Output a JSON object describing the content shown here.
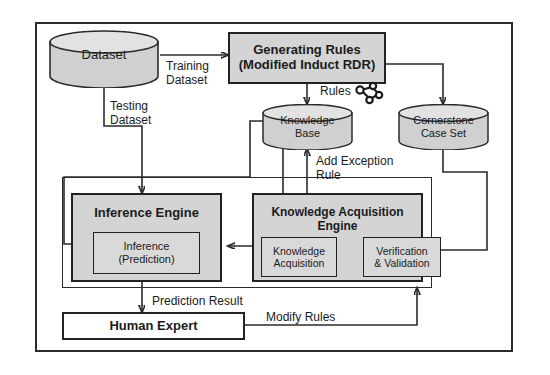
{
  "figure": {
    "type": "block-flow-diagram"
  },
  "outer_frame": {
    "name": "system-boundary"
  },
  "nodes": {
    "dataset": {
      "label": "Dataset",
      "shape": "cylinder"
    },
    "generating_rules": {
      "line1": "Generating Rules",
      "line2": "(Modified Induct RDR)",
      "shape": "process"
    },
    "knowledge_base": {
      "line1": "Knowledge",
      "line2": "Base",
      "shape": "cylinder"
    },
    "cornerstone": {
      "line1": "Cornerstone",
      "line2": "Case Set",
      "shape": "cylinder"
    },
    "inference_engine": {
      "label": "Inference Engine",
      "shape": "process"
    },
    "inference_prediction": {
      "line1": "Inference",
      "line2": "(Prediction)",
      "shape": "process"
    },
    "ka_engine": {
      "label": "Knowledge Acquisition Engine",
      "shape": "process"
    },
    "knowledge_acquisition": {
      "line1": "Knowledge",
      "line2": "Acquisition",
      "shape": "process"
    },
    "verification_validation": {
      "line1": "Verification",
      "line2": "& Validation",
      "shape": "process"
    },
    "human_expert": {
      "label": "Human Expert",
      "shape": "process"
    }
  },
  "edge_labels": {
    "training_dataset": {
      "line1": "Training",
      "line2": "Dataset"
    },
    "testing_dataset": {
      "line1": "Testing",
      "line2": "Dataset"
    },
    "rules": {
      "label": "Rules"
    },
    "add_exception_rule": {
      "line1": "Add Exception",
      "line2": "Rule"
    },
    "prediction_result": {
      "label": "Prediction Result"
    },
    "modify_rules": {
      "label": "Modify Rules"
    }
  },
  "icons": {
    "rules_graph": {
      "name": "rules-network-icon",
      "nodes": 4
    }
  },
  "colors": {
    "stroke": "#2b2b2b",
    "box_fill": "#d4d4d4",
    "cylinder_fill": "#d0d0d0",
    "white_fill": "#ffffff",
    "text": "#1b1b1b"
  }
}
